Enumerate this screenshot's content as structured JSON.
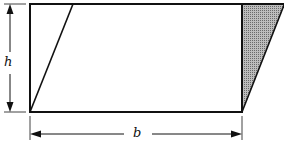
{
  "diagram": {
    "labels": {
      "height": "h",
      "base": "b"
    },
    "colors": {
      "stroke": "#111111",
      "shade": "#8a8a8a",
      "background": "#ffffff"
    }
  }
}
